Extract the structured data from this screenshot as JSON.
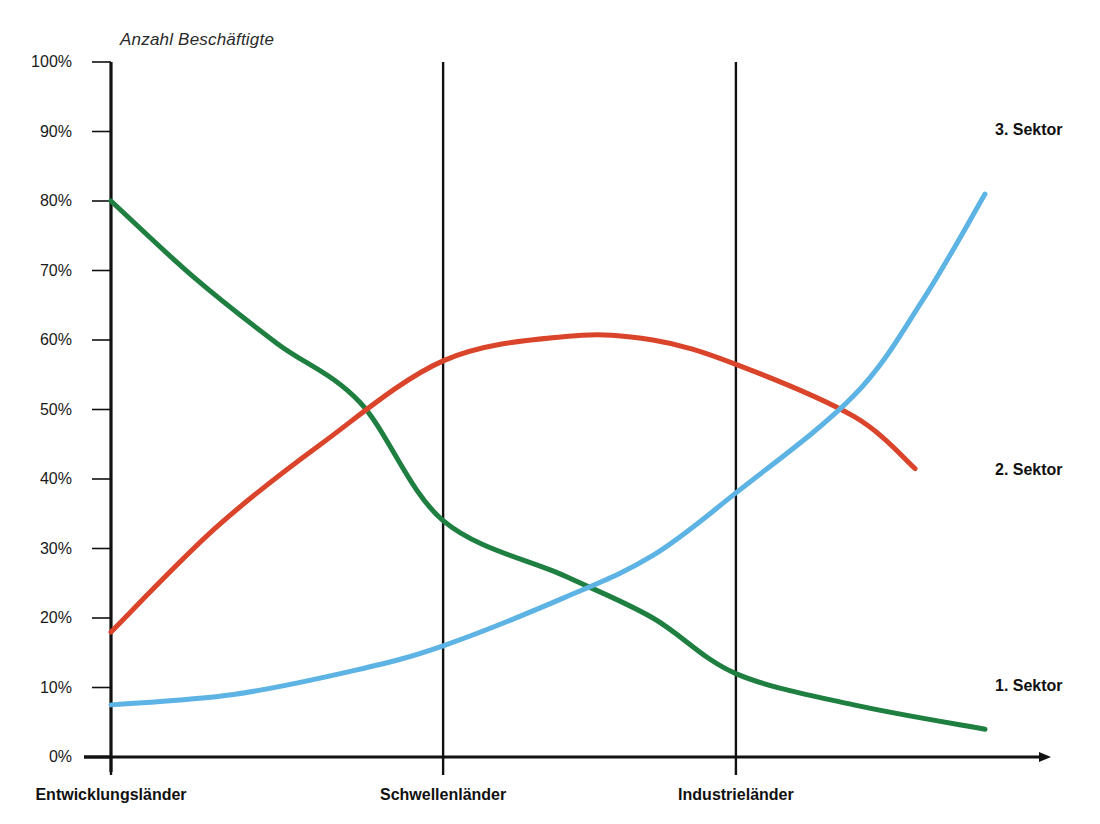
{
  "chart_data": {
    "type": "line",
    "title": "",
    "ylabel": "Anzahl Beschäftigte",
    "xlabel": "",
    "ylim": [
      0,
      100
    ],
    "grid": false,
    "legend_position": "right-of-plot",
    "categories": [
      "Entwicklungsländer",
      "Schwellenländer",
      "Industrieländer"
    ],
    "y_ticks": [
      "0%",
      "10%",
      "20%",
      "30%",
      "40%",
      "50%",
      "60%",
      "70%",
      "80%",
      "90%",
      "100%"
    ],
    "y_tick_values": [
      0,
      10,
      20,
      30,
      40,
      50,
      60,
      70,
      80,
      90,
      100
    ],
    "x_positions_pct": [
      0,
      38,
      71.5,
      100
    ],
    "series": [
      {
        "name": "1. Sektor",
        "color": "#1e7f41",
        "values_at_categories": [
          80,
          34,
          12
        ],
        "value_at_end": 4,
        "points": [
          {
            "x_pct": 0,
            "y": 80
          },
          {
            "x_pct": 9.5,
            "y": 69
          },
          {
            "x_pct": 19,
            "y": 59.5
          },
          {
            "x_pct": 28.5,
            "y": 51
          },
          {
            "x_pct": 38,
            "y": 34
          },
          {
            "x_pct": 52,
            "y": 26
          },
          {
            "x_pct": 62,
            "y": 20
          },
          {
            "x_pct": 71.5,
            "y": 12
          },
          {
            "x_pct": 85,
            "y": 7.5
          },
          {
            "x_pct": 100,
            "y": 4
          }
        ]
      },
      {
        "name": "2. Sektor",
        "color": "#d9442a",
        "values_at_categories": [
          18,
          57,
          56.5
        ],
        "value_at_end": 41.5,
        "points": [
          {
            "x_pct": 0,
            "y": 18
          },
          {
            "x_pct": 12,
            "y": 33
          },
          {
            "x_pct": 24,
            "y": 45
          },
          {
            "x_pct": 38,
            "y": 57
          },
          {
            "x_pct": 52,
            "y": 60.5
          },
          {
            "x_pct": 62,
            "y": 60
          },
          {
            "x_pct": 71.5,
            "y": 56.5
          },
          {
            "x_pct": 85,
            "y": 49
          },
          {
            "x_pct": 92,
            "y": 41.5
          }
        ]
      },
      {
        "name": "3. Sektor",
        "color": "#5cb3e4",
        "values_at_categories": [
          7.5,
          16,
          38
        ],
        "value_at_end": 81,
        "points": [
          {
            "x_pct": 0,
            "y": 7.5
          },
          {
            "x_pct": 14,
            "y": 9
          },
          {
            "x_pct": 28,
            "y": 12.5
          },
          {
            "x_pct": 38,
            "y": 16
          },
          {
            "x_pct": 52,
            "y": 23
          },
          {
            "x_pct": 62,
            "y": 29
          },
          {
            "x_pct": 71.5,
            "y": 38
          },
          {
            "x_pct": 85,
            "y": 52
          },
          {
            "x_pct": 93,
            "y": 66
          },
          {
            "x_pct": 100,
            "y": 81
          }
        ]
      }
    ],
    "crossings": [
      {
        "series": [
          "1. Sektor",
          "2. Sektor"
        ],
        "y": 47
      },
      {
        "series": [
          "1. Sektor",
          "3. Sektor"
        ],
        "y": 23
      },
      {
        "series": [
          "2. Sektor",
          "3. Sektor"
        ],
        "y": 49
      }
    ],
    "annotations": {
      "divider_lines": 2,
      "x_axis_arrow": true
    }
  },
  "colors": {
    "axis": "#111111",
    "sector1": "#1e7f41",
    "sector2": "#d9442a",
    "sector3": "#5cb3e4",
    "background": "#ffffff"
  }
}
